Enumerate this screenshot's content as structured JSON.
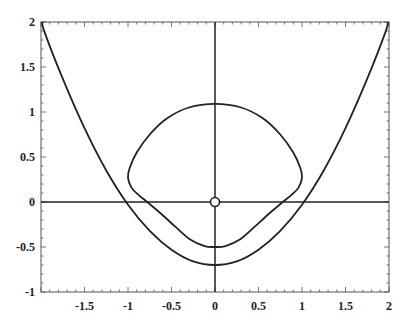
{
  "chart_data": {
    "type": "line",
    "title": "",
    "xlabel": "",
    "ylabel": "",
    "xlim": [
      -2,
      2
    ],
    "ylim": [
      -1,
      2
    ],
    "grid": false,
    "legend": null,
    "x_ticks": [
      -1.5,
      -1,
      -0.5,
      0,
      0.5,
      1,
      1.5,
      2
    ],
    "x_tick_labels": [
      "-1.5",
      "-1",
      "-0.5",
      "0",
      "0.5",
      "1",
      "1.5",
      "2"
    ],
    "y_ticks": [
      -1,
      -0.5,
      0,
      0.5,
      1,
      1.5,
      2
    ],
    "y_tick_labels": [
      "-1",
      "-0.5",
      "0",
      "0.5",
      "1",
      "1.5",
      "2"
    ],
    "axes_lines": {
      "x_axis_at_y": 0,
      "y_axis_at_x": 0
    },
    "annotations": [
      {
        "type": "open-circle-marker",
        "x": 0,
        "y": 0
      }
    ],
    "series": [
      {
        "name": "outer-parabola",
        "kind": "open-curve",
        "x": [
          -1.96,
          -1.75,
          -1.5,
          -1.25,
          -1.0,
          -0.75,
          -0.5,
          -0.25,
          0,
          0.25,
          0.5,
          0.75,
          1.0,
          1.25,
          1.5,
          1.75,
          1.96
        ],
        "y": [
          1.89,
          1.37,
          0.82,
          0.35,
          -0.03,
          -0.32,
          -0.53,
          -0.66,
          -0.7,
          -0.66,
          -0.53,
          -0.32,
          -0.03,
          0.35,
          0.82,
          1.37,
          1.89
        ]
      },
      {
        "name": "inner-closed-curve",
        "kind": "closed-curve",
        "x": [
          0,
          0.3,
          0.55,
          0.75,
          0.9,
          0.98,
          1.0,
          0.96,
          0.88,
          0.78,
          0.62,
          0.45,
          0.28,
          0.12,
          0,
          -0.12,
          -0.28,
          -0.45,
          -0.62,
          -0.78,
          -0.88,
          -0.96,
          -1.0,
          -0.98,
          -0.9,
          -0.75,
          -0.55,
          -0.3,
          0
        ],
        "y": [
          1.09,
          1.05,
          0.93,
          0.75,
          0.55,
          0.38,
          0.27,
          0.16,
          0.08,
          0.0,
          -0.13,
          -0.28,
          -0.42,
          -0.49,
          -0.5,
          -0.49,
          -0.42,
          -0.28,
          -0.13,
          0.0,
          0.08,
          0.16,
          0.27,
          0.38,
          0.55,
          0.75,
          0.93,
          1.05,
          1.09
        ]
      }
    ]
  },
  "plot_area": {
    "left": 41,
    "right": 389,
    "top": 22,
    "bottom": 292
  },
  "colors": {
    "line": "#222222",
    "frame": "#555555",
    "background": "#ffffff"
  }
}
